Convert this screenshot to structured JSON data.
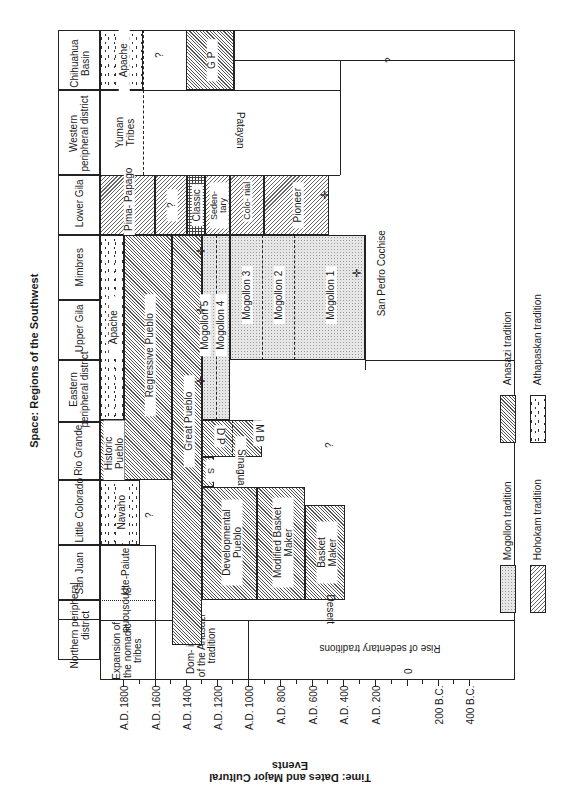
{
  "titles": {
    "space_axis": "Space: Regions of the Southwest",
    "time_axis": "Time: Dates and Major Cultural Events"
  },
  "regions": [
    {
      "label": "Chihuahua Basin"
    },
    {
      "label": "Western peripheral district"
    },
    {
      "label": "Lower Gila"
    },
    {
      "label": "Mimbres"
    },
    {
      "label": "Upper Gila"
    },
    {
      "label": "Eastern peripheral district"
    },
    {
      "label": "Rio Grande"
    },
    {
      "label": "Little Colorado"
    },
    {
      "label": "San Juan"
    },
    {
      "label": "Northern peripheral district"
    }
  ],
  "time_ticks": [
    "A.D. 1800",
    "A.D. 1600",
    "A.D. 1400",
    "A.D. 1200",
    "A.D. 1000",
    "A.D. 800",
    "A.D. 600",
    "A.D. 400",
    "A.D. 200",
    "0",
    "200 B.C.",
    "400 B.C."
  ],
  "events": [
    {
      "label": "Expansion of the nomadic tribes"
    },
    {
      "label": "Dom- inance of the Anasazi tradition"
    },
    {
      "label": "Rise of sedentary traditions"
    }
  ],
  "blocks": {
    "apache_chihuahua": "Apache",
    "q1": "?",
    "gp": "G P",
    "q_chihuahua": "?",
    "yuman": "Yuman Tribes",
    "patayan": "Patayan",
    "pima": "Pima- Papago",
    "q_gila": "?",
    "classic": "Classic",
    "sedentary": "Seden- tary",
    "colonial": "Colo- nial",
    "pioneer": "Pioneer",
    "apache": "Apache",
    "regressive": "Regressive Pueblo",
    "great": "Great Pueblo",
    "mog5": "Mogollon 5",
    "mog4": "Mogollon 4",
    "mog3": "Mogollon 3",
    "mog2": "Mogollon 2",
    "mog1": "Mogollon 1",
    "san_pedro": "San Pedro Cochise",
    "historic": "Historic Pueblo",
    "dp": "D P",
    "s": "S",
    "mb": "M B",
    "sinagua": "Sinagua",
    "q_rio": "?",
    "navaho": "Navaho",
    "q_sj": "?",
    "developmental": "Developmental Pueblo",
    "modified": "Modified Basket Maker",
    "basket": "Basket Maker",
    "ute": "Ute-Paiute",
    "shoshone": "Shoshone",
    "desert": "Desert"
  },
  "legend": [
    {
      "label": "Anasazi tradition",
      "pattern": "diagonal-hatch"
    },
    {
      "label": "Athapaskan tradition",
      "pattern": "speckle"
    },
    {
      "label": "Mogollon tradition",
      "pattern": "stipple"
    },
    {
      "label": "Hohokam tradition",
      "pattern": "wide-hatch"
    }
  ]
}
